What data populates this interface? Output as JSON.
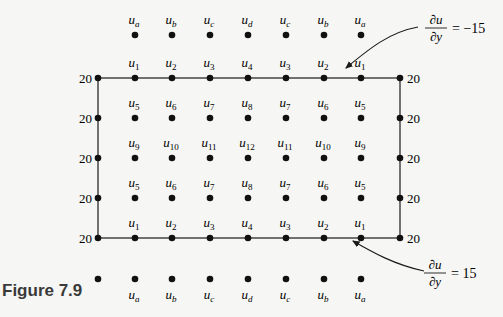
{
  "figure": {
    "label": "Figure 7.9",
    "colors": {
      "background": "#f6f6f4",
      "ink": "#1a1a1a",
      "label": "#3a3a3a"
    }
  },
  "grid": {
    "columns_x": [
      98,
      135,
      172,
      210,
      248,
      286,
      324,
      361,
      400
    ],
    "rows_y": [
      35,
      78,
      118,
      158,
      198,
      238,
      279
    ],
    "boundary_rect": {
      "x1": 98,
      "y1": 78,
      "x2": 400,
      "y2": 238
    },
    "boundary_value": "20",
    "left_boundary_values": [
      "20",
      "20",
      "20",
      "20",
      "20"
    ],
    "right_boundary_values": [
      "20",
      "20",
      "20",
      "20",
      "20"
    ],
    "ghost_top": {
      "subs": [
        "a",
        "b",
        "c",
        "d",
        "c",
        "b",
        "a"
      ]
    },
    "interior_rows": [
      {
        "subs": [
          "1",
          "2",
          "3",
          "4",
          "3",
          "2",
          "1"
        ]
      },
      {
        "subs": [
          "5",
          "6",
          "7",
          "8",
          "7",
          "6",
          "5"
        ]
      },
      {
        "subs": [
          "9",
          "10",
          "11",
          "12",
          "11",
          "10",
          "9"
        ]
      },
      {
        "subs": [
          "5",
          "6",
          "7",
          "8",
          "7",
          "6",
          "5"
        ]
      },
      {
        "subs": [
          "1",
          "2",
          "3",
          "4",
          "3",
          "2",
          "1"
        ]
      }
    ],
    "ghost_bottom": {
      "subs": [
        "a",
        "b",
        "c",
        "d",
        "c",
        "b",
        "a"
      ]
    },
    "variable": "u"
  },
  "annotations": {
    "top": {
      "numerator": "∂u",
      "denominator": "∂y",
      "rhs": "= −15"
    },
    "bottom": {
      "numerator": "∂u",
      "denominator": "∂y",
      "rhs": "= 15"
    }
  }
}
